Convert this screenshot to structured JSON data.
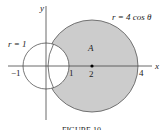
{
  "diagram": {
    "axis_x_label": "x",
    "axis_y_label": "y",
    "curve_big_label": "r = 4 cos θ",
    "curve_small_label": "r = 1",
    "region_label": "A",
    "ticks": [
      "−1",
      "1",
      "2",
      "4"
    ],
    "caption": "FIGURE 10",
    "colors": {
      "shade": "#cccccc",
      "stroke": "#444444"
    }
  }
}
